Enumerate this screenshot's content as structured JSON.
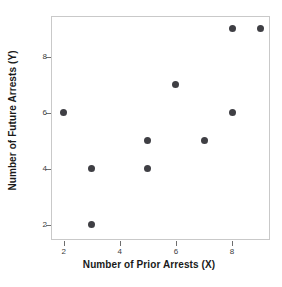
{
  "chart_data": {
    "type": "scatter",
    "title": "",
    "xlabel": "Number of Prior Arrests (X)",
    "ylabel": "Number of Future Arrests (Y)",
    "x": [
      2,
      3,
      3,
      5,
      5,
      6,
      7,
      8,
      8,
      9
    ],
    "y": [
      6,
      4,
      2,
      5,
      4,
      7,
      5,
      9,
      6,
      9
    ],
    "points": [
      {
        "x": 2,
        "y": 6
      },
      {
        "x": 3,
        "y": 4
      },
      {
        "x": 3,
        "y": 2
      },
      {
        "x": 5,
        "y": 5
      },
      {
        "x": 5,
        "y": 4
      },
      {
        "x": 6,
        "y": 7
      },
      {
        "x": 7,
        "y": 5
      },
      {
        "x": 8,
        "y": 9
      },
      {
        "x": 8,
        "y": 6
      },
      {
        "x": 9,
        "y": 9
      }
    ],
    "xlim": [
      1.55,
      9.35
    ],
    "ylim": [
      1.45,
      9.45
    ],
    "xticks": [
      2,
      4,
      6,
      8
    ],
    "xtick_labels": [
      "2",
      "4",
      "6",
      "8"
    ],
    "yticks": [
      2,
      4,
      6,
      8
    ],
    "ytick_labels": [
      "2",
      "4",
      "6",
      "8"
    ],
    "grid": false,
    "legend": null,
    "marker": "filled-circle",
    "marker_color": "#3f3f44",
    "frame_color": "#c9c9c9",
    "background_color": "#ffffff",
    "axis_text_color": "#1a1a1a",
    "tick_text_color": "#3d3d3d"
  }
}
